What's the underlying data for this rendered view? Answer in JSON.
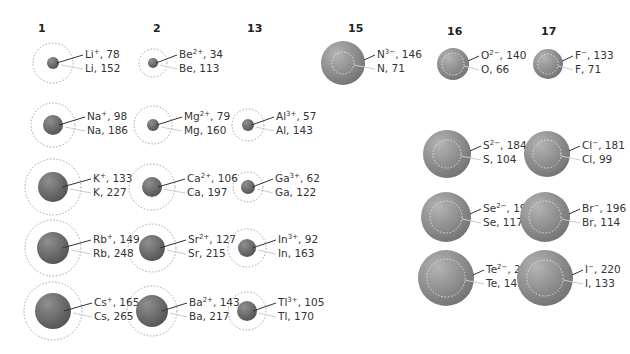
{
  "colors": {
    "sphere_dark": "#5e5e5e",
    "sphere_light": "#8f8f8f",
    "anion_sphere_dark": "#7a7a7a",
    "anion_sphere_light": "#b0b0b0",
    "dotted_outline": "#999999",
    "ion_leader": "#333333",
    "atom_leader": "#cccccc"
  },
  "groups": [
    {
      "label": "1",
      "x": 38,
      "y": 32
    },
    {
      "label": "2",
      "x": 153,
      "y": 32
    },
    {
      "label": "13",
      "x": 247,
      "y": 32
    },
    {
      "label": "15",
      "x": 348,
      "y": 32
    },
    {
      "label": "16",
      "x": 447,
      "y": 35
    },
    {
      "label": "17",
      "x": 541,
      "y": 35
    }
  ],
  "elements": [
    {
      "ion": "Li",
      "charge": "+",
      "ion_radius": 78,
      "atom": "Li",
      "atom_radius": 152,
      "cx": 53,
      "cy": 63,
      "r_ion": 6,
      "r_atom": 20,
      "type": "cation"
    },
    {
      "ion": "Na",
      "charge": "+",
      "ion_radius": 98,
      "atom": "Na",
      "atom_radius": 186,
      "cx": 53,
      "cy": 125,
      "r_ion": 10,
      "r_atom": 22,
      "type": "cation"
    },
    {
      "ion": "K",
      "charge": "+",
      "ion_radius": 133,
      "atom": "K",
      "atom_radius": 227,
      "cx": 53,
      "cy": 187,
      "r_ion": 15,
      "r_atom": 28,
      "type": "cation"
    },
    {
      "ion": "Rb",
      "charge": "+",
      "ion_radius": 149,
      "atom": "Rb",
      "atom_radius": 248,
      "cx": 53,
      "cy": 248,
      "r_ion": 16,
      "r_atom": 28,
      "type": "cation"
    },
    {
      "ion": "Cs",
      "charge": "+",
      "ion_radius": 165,
      "atom": "Cs",
      "atom_radius": 265,
      "cx": 53,
      "cy": 311,
      "r_ion": 18,
      "r_atom": 29,
      "type": "cation"
    },
    {
      "ion": "Be",
      "charge": "2+",
      "ion_radius": 34,
      "atom": "Be",
      "atom_radius": 113,
      "cx": 153,
      "cy": 63,
      "r_ion": 5,
      "r_atom": 14,
      "type": "cation"
    },
    {
      "ion": "Mg",
      "charge": "2+",
      "ion_radius": 79,
      "atom": "Mg",
      "atom_radius": 160,
      "cx": 153,
      "cy": 125,
      "r_ion": 6,
      "r_atom": 19,
      "type": "cation"
    },
    {
      "ion": "Ca",
      "charge": "2+",
      "ion_radius": 106,
      "atom": "Ca",
      "atom_radius": 197,
      "cx": 152,
      "cy": 187,
      "r_ion": 10,
      "r_atom": 23,
      "type": "cation"
    },
    {
      "ion": "Sr",
      "charge": "2+",
      "ion_radius": 127,
      "atom": "Sr",
      "atom_radius": 215,
      "cx": 152,
      "cy": 248,
      "r_ion": 13,
      "r_atom": 24,
      "type": "cation"
    },
    {
      "ion": "Ba",
      "charge": "2+",
      "ion_radius": 143,
      "atom": "Ba",
      "atom_radius": 217,
      "cx": 152,
      "cy": 311,
      "r_ion": 16,
      "r_atom": 25,
      "type": "cation"
    },
    {
      "ion": "Al",
      "charge": "3+",
      "ion_radius": 57,
      "atom": "Al",
      "atom_radius": 143,
      "cx": 248,
      "cy": 125,
      "r_ion": 6,
      "r_atom": 16,
      "type": "cation"
    },
    {
      "ion": "Ga",
      "charge": "3+",
      "ion_radius": 62,
      "atom": "Ga",
      "atom_radius": 122,
      "cx": 248,
      "cy": 187,
      "r_ion": 7,
      "r_atom": 15,
      "type": "cation"
    },
    {
      "ion": "In",
      "charge": "3+",
      "ion_radius": 92,
      "atom": "In",
      "atom_radius": 163,
      "cx": 247,
      "cy": 248,
      "r_ion": 9,
      "r_atom": 19,
      "type": "cation"
    },
    {
      "ion": "Tl",
      "charge": "3+",
      "ion_radius": 105,
      "atom": "Tl",
      "atom_radius": 170,
      "cx": 247,
      "cy": 311,
      "r_ion": 10,
      "r_atom": 19,
      "type": "cation"
    },
    {
      "ion": "N",
      "charge": "3−",
      "ion_radius": 146,
      "atom": "N",
      "atom_radius": 71,
      "cx": 343,
      "cy": 63,
      "r_ion": 22,
      "r_atom": 11,
      "type": "anion"
    },
    {
      "ion": "O",
      "charge": "2−",
      "ion_radius": 140,
      "atom": "O",
      "atom_radius": 66,
      "cx": 453,
      "cy": 64,
      "r_ion": 16,
      "r_atom": 11,
      "type": "anion"
    },
    {
      "ion": "S",
      "charge": "2−",
      "ion_radius": 184,
      "atom": "S",
      "atom_radius": 104,
      "cx": 447,
      "cy": 154,
      "r_ion": 24,
      "r_atom": 14,
      "type": "anion"
    },
    {
      "ion": "Se",
      "charge": "2−",
      "ion_radius": 191,
      "atom": "Se",
      "atom_radius": 117,
      "cx": 446,
      "cy": 217,
      "r_ion": 25,
      "r_atom": 16,
      "type": "anion"
    },
    {
      "ion": "Te",
      "charge": "2−",
      "ion_radius": 211,
      "atom": "Te",
      "atom_radius": 143,
      "cx": 446,
      "cy": 278,
      "r_ion": 28,
      "r_atom": 19,
      "type": "anion"
    },
    {
      "ion": "F",
      "charge": "−",
      "ion_radius": 133,
      "atom": "F",
      "atom_radius": 71,
      "cx": 548,
      "cy": 64,
      "r_ion": 15,
      "r_atom": 10,
      "type": "anion"
    },
    {
      "ion": "Cl",
      "charge": "−",
      "ion_radius": 181,
      "atom": "Cl",
      "atom_radius": 99,
      "cx": 547,
      "cy": 154,
      "r_ion": 23,
      "r_atom": 14,
      "type": "anion"
    },
    {
      "ion": "Br",
      "charge": "−",
      "ion_radius": 196,
      "atom": "Br",
      "atom_radius": 114,
      "cx": 545,
      "cy": 217,
      "r_ion": 25,
      "r_atom": 16,
      "type": "anion"
    },
    {
      "ion": "I",
      "charge": "−",
      "ion_radius": 220,
      "atom": "I",
      "atom_radius": 133,
      "cx": 545,
      "cy": 278,
      "r_ion": 28,
      "r_atom": 18,
      "type": "anion"
    }
  ]
}
